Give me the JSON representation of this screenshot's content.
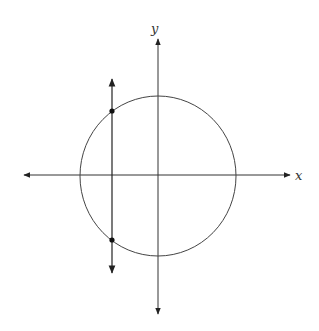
{
  "diagram": {
    "type": "coordinate-plane",
    "axes": {
      "x_label": "x",
      "y_label": "y",
      "color": "#333333"
    },
    "circle": {
      "center": [
        158,
        176
      ],
      "radius": 79,
      "stroke": "#444444"
    },
    "vertical_line": {
      "x": 112,
      "y_top": 77,
      "y_bottom": 275
    },
    "intersection_points": [
      {
        "name": "upper-point",
        "x": 112,
        "y": 111
      },
      {
        "name": "lower-point",
        "x": 112,
        "y": 240
      }
    ]
  }
}
